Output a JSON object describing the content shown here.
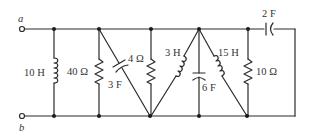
{
  "diagram": {
    "type": "circuit-schematic",
    "terminals": [
      {
        "id": "a",
        "label": "a"
      },
      {
        "id": "b",
        "label": "b"
      }
    ],
    "components": [
      {
        "id": "L1",
        "kind": "inductor",
        "label": "10 H",
        "position": "shunt between top and bottom rails, first branch"
      },
      {
        "id": "R1",
        "kind": "resistor",
        "label": "40 Ω",
        "position": "shunt, second branch"
      },
      {
        "id": "C1",
        "kind": "capacitor",
        "label": "3 F",
        "position": "diagonal from top node to bottom node"
      },
      {
        "id": "R2",
        "kind": "resistor",
        "label": "4 Ω",
        "position": "shunt, third branch"
      },
      {
        "id": "L2",
        "kind": "inductor",
        "label": "3 H",
        "position": "diagonal from top apex to bottom-left node"
      },
      {
        "id": "C2",
        "kind": "capacitor",
        "label": "6 F",
        "position": "vertical from top apex to bottom"
      },
      {
        "id": "L3",
        "kind": "inductor",
        "label": "15 H",
        "position": "diagonal from top apex to bottom-right node"
      },
      {
        "id": "R3",
        "kind": "resistor",
        "label": "10 Ω",
        "position": "shunt, right branch"
      },
      {
        "id": "C3",
        "kind": "capacitor",
        "label": "2 F",
        "position": "series on top rail to right return"
      }
    ]
  },
  "labels": {
    "a": "a",
    "b": "b",
    "L1": "10 H",
    "R1": "40 Ω",
    "C1": "3 F",
    "R2": "4 Ω",
    "L2": "3 H",
    "C2": "6 F",
    "L3": "15 H",
    "R3": "10 Ω",
    "C3": "2 F"
  },
  "colors": {
    "wire": "#2b2b2b",
    "text": "#333333",
    "background": "#ffffff"
  }
}
